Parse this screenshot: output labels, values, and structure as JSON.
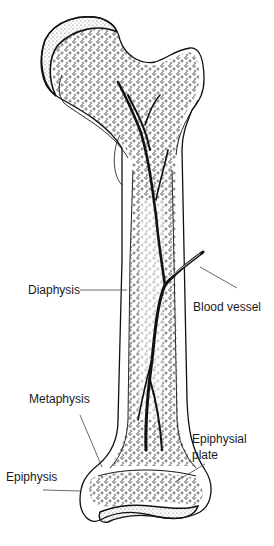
{
  "diagram": {
    "labels": {
      "diaphysis": "Diaphysis",
      "blood_vessel": "Blood vessel",
      "metaphysis": "Metaphysis",
      "epiphysis": "Epiphysis",
      "epiphysial_plate_line1": "Epiphysial",
      "epiphysial_plate_line2": "plate"
    },
    "colors": {
      "ink": "#111111",
      "background": "#ffffff",
      "leader": "#444444"
    }
  }
}
